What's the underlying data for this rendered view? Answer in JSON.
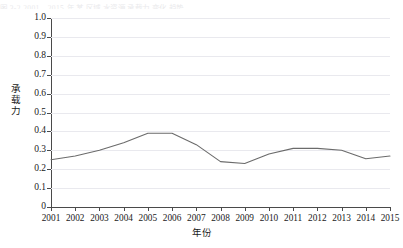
{
  "figure": {
    "background_color": "#ffffff",
    "top_cropped_text": "图 3-2  2001—2015 年 某 区域 水资源 承载力 变化 趋势"
  },
  "chart_data": {
    "type": "line",
    "title": "",
    "xlabel": "年份",
    "ylabel": "承载力",
    "categories": [
      "2001",
      "2002",
      "2003",
      "2004",
      "2005",
      "2006",
      "2007",
      "2008",
      "2009",
      "2010",
      "2011",
      "2012",
      "2013",
      "2014",
      "2015"
    ],
    "x": [
      2001,
      2002,
      2003,
      2004,
      2005,
      2006,
      2007,
      2008,
      2009,
      2010,
      2011,
      2012,
      2013,
      2014,
      2015
    ],
    "values": [
      0.25,
      0.27,
      0.3,
      0.34,
      0.39,
      0.39,
      0.33,
      0.24,
      0.23,
      0.28,
      0.31,
      0.31,
      0.3,
      0.255,
      0.27
    ],
    "series": [
      {
        "name": "承载力",
        "values": [
          0.25,
          0.27,
          0.3,
          0.34,
          0.39,
          0.39,
          0.33,
          0.24,
          0.23,
          0.28,
          0.31,
          0.31,
          0.3,
          0.255,
          0.27
        ],
        "color": "#6b6b6b",
        "line_width": 1.1,
        "markers": "none"
      }
    ],
    "ylim": [
      0,
      1.0
    ],
    "ytick_values": [
      0,
      0.1,
      0.2,
      0.3,
      0.4,
      0.5,
      0.6,
      0.7,
      0.8,
      0.9,
      1.0
    ],
    "ytick_labels": [
      "0",
      "0.1",
      "0.2",
      "0.3",
      "0.4",
      "0.5",
      "0.6",
      "0.7",
      "0.8",
      "0.9",
      "1.0"
    ],
    "xlim": [
      2001,
      2015
    ],
    "grid": {
      "horizontal": true,
      "vertical": false,
      "color": "#e9e9ee"
    },
    "legend": {
      "visible": false,
      "position": "none"
    },
    "axis_color": "#4a4a4a",
    "ylabel_chars": [
      "承",
      "载",
      "力"
    ]
  }
}
